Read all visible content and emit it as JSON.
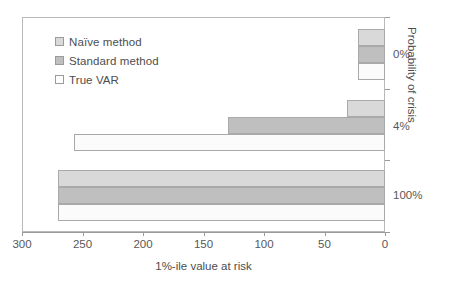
{
  "chart_data": {
    "type": "bar",
    "orientation": "horizontal",
    "title": "",
    "xlabel": "1%-ile value at risk",
    "ylabel": "Probability of crisis",
    "categories": [
      "0%",
      "4%",
      "100%"
    ],
    "series": [
      {
        "name": "Naïve method",
        "values": [
          22,
          31,
          270
        ],
        "color": "#d9d9d9"
      },
      {
        "name": "Standard method",
        "values": [
          22,
          130,
          270
        ],
        "color": "#bfbfbf"
      },
      {
        "name": "True VAR",
        "values": [
          22,
          257,
          270
        ],
        "color": "#fbfbfb"
      }
    ],
    "xlim": [
      300,
      0
    ],
    "x_reversed": true,
    "xticks": [
      300,
      250,
      200,
      150,
      100,
      50,
      0
    ],
    "xticklabels": [
      "300",
      "250",
      "200",
      "150",
      "100",
      "50",
      "0"
    ],
    "yticklabels": [
      "0%",
      "4%",
      "100%"
    ],
    "grid": false,
    "legend_position": "upper-left",
    "frame": true
  },
  "legend": {
    "items": [
      {
        "label": "Naïve method"
      },
      {
        "label": "Standard method"
      },
      {
        "label": "True VAR"
      }
    ]
  },
  "axes": {
    "x_title": "1%-ile value at risk",
    "y_title": "Probability of crisis",
    "x_tick_labels": [
      "300",
      "250",
      "200",
      "150",
      "100",
      "50",
      "0"
    ],
    "y_tick_labels": [
      "0%",
      "4%",
      "100%"
    ]
  },
  "colors": {
    "naive": "#d9d9d9",
    "standard": "#bfbfbf",
    "true_var": "#fbfbfb",
    "axis": "#9b9b9d",
    "text": "#58585a"
  }
}
